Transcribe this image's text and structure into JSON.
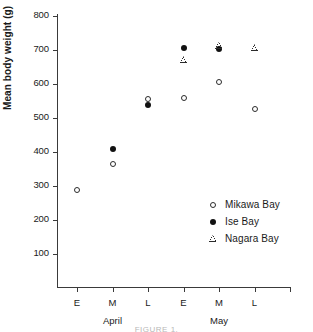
{
  "chart_data": {
    "type": "scatter",
    "title": "",
    "xlabel": "",
    "ylabel": "Mean body weight (g)",
    "ylim": [
      0,
      800
    ],
    "yticks": [
      100,
      200,
      300,
      400,
      500,
      600,
      700,
      800
    ],
    "ytick_labels": [
      "100",
      "200",
      "300",
      "400",
      "500",
      "600",
      "700",
      "800"
    ],
    "grid": false,
    "legend_position": "lower-right",
    "x_categories": [
      "E",
      "M",
      "L",
      "E",
      "M",
      "L"
    ],
    "x_tick_labels": [
      "E",
      "M",
      "L",
      "E",
      "M",
      "L",
      ""
    ],
    "x_group_labels": [
      "April",
      "May"
    ],
    "series": [
      {
        "name": "Mikawa Bay",
        "marker": "open-circle",
        "color": "#2b2b2b",
        "points": [
          {
            "x": "April E",
            "xi": 0,
            "y": 288
          },
          {
            "x": "April M",
            "xi": 1,
            "y": 364
          },
          {
            "x": "April L",
            "xi": 2,
            "y": 557
          },
          {
            "x": "May E",
            "xi": 3,
            "y": 560
          },
          {
            "x": "May M",
            "xi": 4,
            "y": 606
          },
          {
            "x": "May L",
            "xi": 5,
            "y": 527
          }
        ]
      },
      {
        "name": "Ise Bay",
        "marker": "filled-circle",
        "color": "#111111",
        "points": [
          {
            "x": "April M",
            "xi": 1,
            "y": 408
          },
          {
            "x": "April L",
            "xi": 2,
            "y": 537
          },
          {
            "x": "May E",
            "xi": 3,
            "y": 707
          },
          {
            "x": "May M",
            "xi": 4,
            "y": 703
          }
        ]
      },
      {
        "name": "Nagara Bay",
        "marker": "open-triangle",
        "color": "#2b2b2b",
        "points": [
          {
            "x": "May E",
            "xi": 3,
            "y": 672
          },
          {
            "x": "May M",
            "xi": 4,
            "y": 712
          },
          {
            "x": "May L",
            "xi": 5,
            "y": 707
          }
        ]
      }
    ]
  },
  "legend": {
    "entries": [
      {
        "label": "Mikawa Bay",
        "marker": "open-circle"
      },
      {
        "label": "Ise Bay",
        "marker": "filled-circle"
      },
      {
        "label": "Nagara Bay",
        "marker": "open-triangle"
      }
    ]
  },
  "caption": "FIGURE 1."
}
